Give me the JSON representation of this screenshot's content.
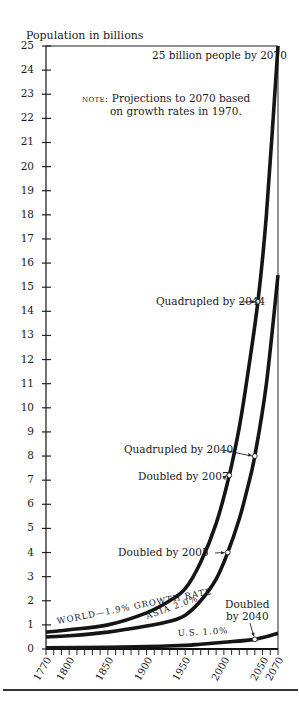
{
  "chart_data": {
    "type": "line",
    "title": "",
    "ylabel": "Population in billions",
    "xlabel": "",
    "ylim": [
      0,
      25
    ],
    "xlim": [
      1770,
      2070
    ],
    "yticks": [
      0,
      1,
      2,
      3,
      4,
      5,
      6,
      7,
      8,
      9,
      10,
      11,
      12,
      13,
      14,
      15,
      16,
      17,
      18,
      19,
      20,
      21,
      22,
      23,
      24,
      25
    ],
    "xticks": [
      1770,
      1800,
      1850,
      1900,
      1950,
      2000,
      2050,
      2070
    ],
    "grid": false,
    "legend": "inline labels on curves",
    "series": [
      {
        "name": "WORLD—1.9% GROWTH RATE",
        "x": [
          1770,
          1800,
          1850,
          1900,
          1930,
          1950,
          1970,
          1990,
          2007,
          2020,
          2030,
          2044,
          2055,
          2070
        ],
        "values": [
          0.7,
          0.8,
          1.0,
          1.5,
          2.0,
          2.5,
          3.6,
          5.2,
          7.2,
          9.2,
          11.2,
          14.4,
          18.0,
          25.0
        ]
      },
      {
        "name": "ASIA 2.0%",
        "x": [
          1770,
          1800,
          1850,
          1900,
          1930,
          1950,
          1970,
          1990,
          2005,
          2020,
          2030,
          2040,
          2055,
          2070
        ],
        "values": [
          0.5,
          0.55,
          0.7,
          0.95,
          1.15,
          1.4,
          2.0,
          2.9,
          4.0,
          5.4,
          6.6,
          8.0,
          11.0,
          15.5
        ]
      },
      {
        "name": "U.S. 1.0%",
        "x": [
          1770,
          1850,
          1900,
          1950,
          1970,
          2000,
          2040,
          2070
        ],
        "values": [
          0.05,
          0.07,
          0.1,
          0.15,
          0.2,
          0.28,
          0.4,
          0.65
        ]
      }
    ],
    "markers": [
      {
        "series": "WORLD",
        "year": 2007,
        "value": 7.2,
        "label": "Doubled by 2007"
      },
      {
        "series": "WORLD",
        "year": 2044,
        "value": 14.4,
        "label": "Quadrupled by 2044"
      },
      {
        "series": "ASIA",
        "year": 2005,
        "value": 4.0,
        "label": "Doubled by 2005"
      },
      {
        "series": "ASIA",
        "year": 2040,
        "value": 8.0,
        "label": "Quadrupled by 2040"
      },
      {
        "series": "U.S.",
        "year": 2040,
        "value": 0.4,
        "label": "Doubled by 2040"
      }
    ],
    "annotations": [
      "25 billion people by 2070",
      "NOTE: Projections to 2070 based on growth rates in 1970."
    ]
  },
  "labels": {
    "ylabel": "Population in billions",
    "top_annotation": "25 billion people by 2070",
    "note_prefix": "note:",
    "note_line1": " Projections to 2070 based",
    "note_line2": "on growth rates in 1970.",
    "world_label": "WORLD—1.9%  GROWTH RATE",
    "asia_label": "ASIA 2.0%",
    "us_label": "U.S. 1.0%",
    "marker_world_2044": "Quadrupled by 2044",
    "marker_asia_2040": "Quadrupled by 2040",
    "marker_world_2007": "Doubled by 2007",
    "marker_asia_2005": "Doubled by 2005",
    "marker_us_2040_line1": "Doubled",
    "marker_us_2040_line2": "by 2040"
  },
  "yticks": [
    "0",
    "1",
    "2",
    "3",
    "4",
    "5",
    "6",
    "7",
    "8",
    "9",
    "10",
    "11",
    "12",
    "13",
    "14",
    "15",
    "16",
    "17",
    "18",
    "19",
    "20",
    "21",
    "22",
    "23",
    "24",
    "25"
  ],
  "xticks": [
    "1770",
    "1800",
    "1850",
    "1900",
    "1950",
    "2000",
    "2050",
    "2070"
  ]
}
